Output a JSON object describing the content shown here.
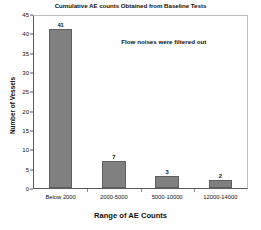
{
  "chart_data": {
    "type": "bar",
    "title": "Cumulative AE counts Obtained from Baseline Tests",
    "xlabel": "Range of AE Counts",
    "ylabel": "Number of Vessels",
    "categories": [
      "Below 2000",
      "2000-5000",
      "5000-10000",
      "12000-14000"
    ],
    "values": [
      41,
      7,
      3,
      2
    ],
    "value_labels": [
      "41",
      "7",
      "3",
      "2"
    ],
    "ylim": [
      0,
      45
    ],
    "yticks": [
      0,
      5,
      10,
      15,
      20,
      25,
      30,
      35,
      40,
      45
    ],
    "ytick_labels": [
      "0",
      "5",
      "10",
      "15",
      "20",
      "25",
      "30",
      "35",
      "40",
      "45"
    ],
    "grid": false,
    "legend": null,
    "annotations": [
      {
        "text": "Flow noises were filtered out",
        "x_frac": 0.41,
        "y_value": 39
      }
    ],
    "colors": {
      "bar_fill": "#808080",
      "bar_edge": "#5f5f5f",
      "axis": "#5a5a5a",
      "frame": "#bfbfbf",
      "text": "#111111",
      "background": "#ffffff"
    }
  }
}
